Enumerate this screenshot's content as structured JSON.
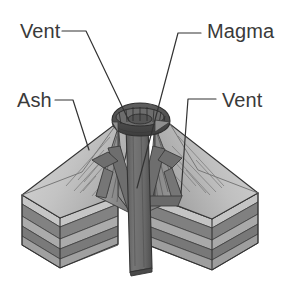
{
  "diagram": {
    "background_color": "#ffffff",
    "width": 285,
    "height": 295,
    "labels": [
      {
        "id": "vent-top",
        "text": "Vent",
        "text_x": 20,
        "text_y": 38,
        "anchor": "start",
        "leader": "M62,31 L86,31 L129,121",
        "target": "crater-rim"
      },
      {
        "id": "magma",
        "text": "Magma",
        "text_x": 207,
        "text_y": 38,
        "anchor": "start",
        "leader": "M201,33 L178,33 L137,188",
        "target": "magma-conduit"
      },
      {
        "id": "ash",
        "text": "Ash",
        "text_x": 17,
        "text_y": 107,
        "anchor": "start",
        "leader": "M55,100 L73,100 L89,150",
        "target": "ash-flank-left"
      },
      {
        "id": "vent-right",
        "text": "Vent",
        "text_x": 222,
        "text_y": 107,
        "anchor": "start",
        "leader": "M216,99 L188,99 L181,193",
        "target": "side-vent-right"
      }
    ],
    "parts": [
      {
        "id": "crater-rim",
        "name": "Crater rim",
        "color": "#555555"
      },
      {
        "id": "magma-conduit",
        "name": "Central magma conduit",
        "color": "#6b6b6b"
      },
      {
        "id": "ash-flank-left",
        "name": "Left ash cone flank",
        "color": "#c9c9c9"
      },
      {
        "id": "ash-flank-right",
        "name": "Right ash cone flank",
        "color": "#c9c9c9"
      },
      {
        "id": "side-vent-left",
        "name": "Left side vent (dike)",
        "color": "#6e6e6e"
      },
      {
        "id": "side-vent-right",
        "name": "Right side vent (dike)",
        "color": "#6e6e6e"
      },
      {
        "id": "strata-block-left",
        "name": "Left rock strata block",
        "color": "#9a9a9a"
      },
      {
        "id": "strata-block-right",
        "name": "Right rock strata block",
        "color": "#9a9a9a"
      }
    ],
    "strata_layers": [
      {
        "index": 0,
        "shade": "#c2c2c2"
      },
      {
        "index": 1,
        "shade": "#858585"
      },
      {
        "index": 2,
        "shade": "#adadad"
      },
      {
        "index": 3,
        "shade": "#7d7d7d"
      },
      {
        "index": 4,
        "shade": "#a5a5a5"
      },
      {
        "index": 5,
        "shade": "#767676"
      }
    ],
    "colors": {
      "outline": "#333333",
      "ash_light": "#cfcfcf",
      "ash_mid": "#b3b3b3",
      "ash_shadow": "#8f8f8f",
      "conduit_dark": "#6b6b6b",
      "conduit_darker": "#4f4f4f",
      "crater_dark": "#4a4a4a",
      "label_text": "#3a3a3a"
    }
  }
}
